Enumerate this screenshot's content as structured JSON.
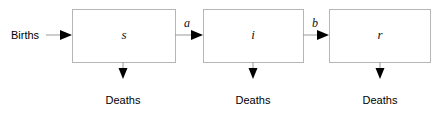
{
  "diagram": {
    "type": "flow-diagram",
    "background_color": "#ffffff",
    "box_stroke_color": "#b6b6b6",
    "line_color": "#9a9a9a",
    "arrowhead_color": "#000000",
    "text_color": "#000000",
    "boxes": [
      {
        "id": "s",
        "label": "s",
        "x": 72,
        "y": 9,
        "width": 103,
        "height": 53
      },
      {
        "id": "i",
        "label": "i",
        "x": 203,
        "y": 9,
        "width": 100,
        "height": 53
      },
      {
        "id": "r",
        "label": "r",
        "x": 329,
        "y": 9,
        "width": 101,
        "height": 53
      }
    ],
    "inflow": {
      "label": "Births",
      "label_x": 24,
      "label_y": 39,
      "arrow_y": 35,
      "line_start_x": 46,
      "line_end_x": 72
    },
    "transitions": [
      {
        "id": "a",
        "label": "a",
        "label_x": 186,
        "label_y": 26,
        "arrow_y": 35,
        "line_start_x": 175,
        "line_end_x": 203
      },
      {
        "id": "b",
        "label": "b",
        "label_x": 314,
        "label_y": 26,
        "arrow_y": 35,
        "line_start_x": 303,
        "line_end_x": 329
      }
    ],
    "outflows": [
      {
        "id": "deaths-s",
        "label": "Deaths",
        "x": 123,
        "line_top_y": 62,
        "line_bottom_y": 78,
        "label_y": 101
      },
      {
        "id": "deaths-i",
        "label": "Deaths",
        "x": 253,
        "line_top_y": 62,
        "line_bottom_y": 78,
        "label_y": 101
      },
      {
        "id": "deaths-r",
        "label": "Deaths",
        "x": 380,
        "line_top_y": 62,
        "line_bottom_y": 78,
        "label_y": 101
      }
    ]
  }
}
